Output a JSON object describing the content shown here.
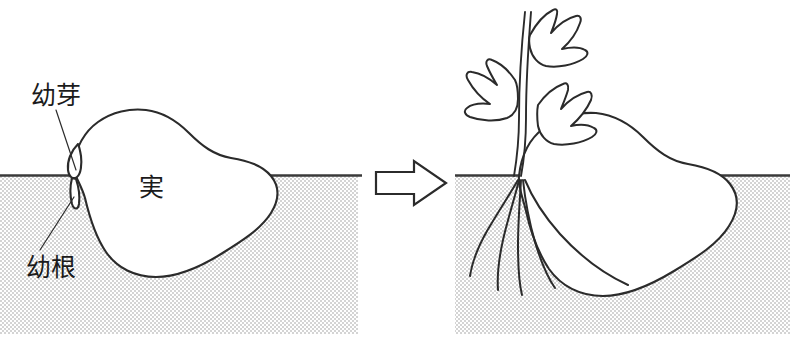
{
  "figure": {
    "background_color": "#ffffff",
    "ink_color": "#2b2b2b",
    "soil_color": "#e9e9e9",
    "ground_line_color": "#3a3a3a"
  },
  "labels": {
    "plumule": "幼芽",
    "radicle": "幼根",
    "seed": "実"
  },
  "panels": {
    "left": {
      "name": "before-germination",
      "soil_rect": {
        "x": 0,
        "y": 176,
        "width": 358,
        "height": 158
      },
      "ground_line": {
        "x1": 0,
        "y1": 175,
        "x2": 362,
        "y2": 175
      },
      "seed_label": "実"
    },
    "right": {
      "name": "after-germination",
      "soil_rect": {
        "x": 455,
        "y": 176,
        "width": 335,
        "height": 158
      },
      "ground_line": {
        "x1": 455,
        "y1": 175,
        "x2": 790,
        "y2": 175
      },
      "leaf_count": 3,
      "root_count": 5
    }
  },
  "arrow": {
    "name": "transformation-arrow",
    "direction": "right",
    "x": 374,
    "y": 160,
    "width": 72,
    "height": 46
  }
}
